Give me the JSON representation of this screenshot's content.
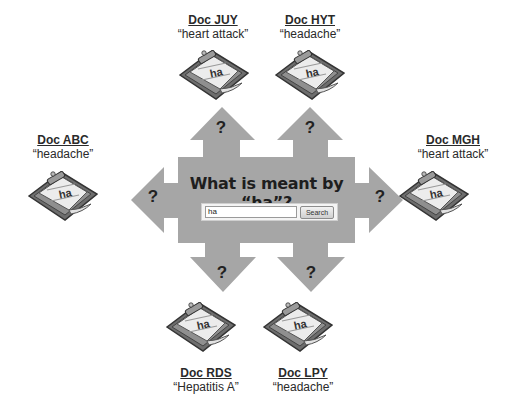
{
  "center": {
    "title": "What is meant by “ha”?",
    "search_value": "ha",
    "search_button": "Search",
    "arrow_label": "?"
  },
  "colors": {
    "arrow_fill": "#a6a6a6",
    "text": "#222222"
  },
  "documents": [
    {
      "name": "Doc JUY",
      "meaning": "“heart attack”",
      "note": "ha",
      "position": "top-left"
    },
    {
      "name": "Doc HYT",
      "meaning": "“headache”",
      "note": "ha",
      "position": "top-right"
    },
    {
      "name": "Doc ABC",
      "meaning": "“headache”",
      "note": "ha",
      "position": "left"
    },
    {
      "name": "Doc MGH",
      "meaning": "“heart attack”",
      "note": "ha",
      "position": "right"
    },
    {
      "name": "Doc RDS",
      "meaning": "“Hepatitis A”",
      "note": "ha",
      "position": "bottom-left"
    },
    {
      "name": "Doc LPY",
      "meaning": "“headache”",
      "note": "ha",
      "position": "bottom-right"
    }
  ]
}
